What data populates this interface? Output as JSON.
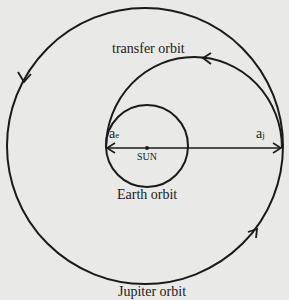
{
  "diagram": {
    "labels": {
      "transfer_orbit": "transfer orbit",
      "earth_orbit": "Earth orbit",
      "jupiter_orbit": "Jupiter orbit",
      "sun": "SUN",
      "a_e_base": "a",
      "a_e_sub": "e",
      "a_j_base": "a",
      "a_j_sub": "j"
    },
    "elements": {
      "jupiter_orbit": {
        "shape": "circle",
        "cx": 145,
        "cy": 146,
        "r": 138
      },
      "earth_orbit": {
        "shape": "circle",
        "cx": 147,
        "cy": 146,
        "r": 41
      },
      "transfer_orbit": {
        "shape": "half-ellipse (upper)",
        "from_x": 106,
        "to_x": 282,
        "top_y": 57
      },
      "sun": {
        "shape": "dot",
        "x": 147,
        "y": 148
      },
      "axis_line": {
        "from": [
          106,
          148
        ],
        "to": [
          282,
          148
        ],
        "arrows": "both ends"
      },
      "direction": "counter-clockwise"
    },
    "colors": {
      "background": "#e9e9e7",
      "ink": "#1a1a1a"
    }
  }
}
